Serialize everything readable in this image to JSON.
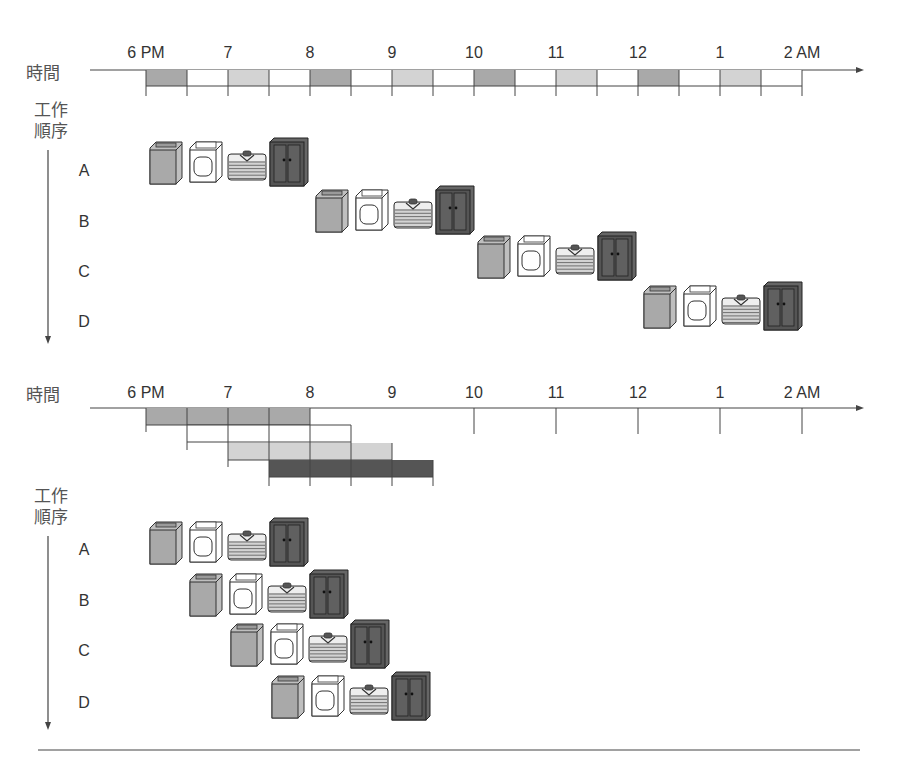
{
  "colors": {
    "washer": "#a9a9a9",
    "dryer": "#ffffff",
    "folder": "#d3d3d3",
    "closet": "#555555",
    "line": "#444444"
  },
  "icons": {
    "washer": "washing-machine-icon",
    "dryer": "dryer-icon",
    "folder": "folded-clothes-icon",
    "closet": "wardrobe-icon"
  },
  "sequential": {
    "time_axis_title": "時間",
    "task_axis_title": [
      "工作",
      "順序"
    ],
    "ticks": [
      "6 PM",
      "7",
      "8",
      "9",
      "10",
      "11",
      "12",
      "1",
      "2 AM"
    ],
    "jobs": [
      "A",
      "B",
      "C",
      "D"
    ]
  },
  "pipelined": {
    "time_axis_title": "時間",
    "task_axis_title": [
      "工作",
      "順序"
    ],
    "ticks": [
      "6 PM",
      "7",
      "8",
      "9",
      "10",
      "11",
      "12",
      "1",
      "2 AM"
    ],
    "jobs": [
      "A",
      "B",
      "C",
      "D"
    ]
  },
  "chart_data": [
    {
      "type": "gantt",
      "title": "Sequential laundry",
      "xlabel": "時間",
      "ylabel": "工作順序",
      "x_ticks": [
        "6 PM",
        "7",
        "8",
        "9",
        "10",
        "11",
        "12",
        "1",
        "2 AM"
      ],
      "stage_duration_minutes": 30,
      "stages": [
        "wash",
        "dry",
        "fold",
        "store"
      ],
      "tasks": [
        {
          "name": "A",
          "start": "6:00 PM",
          "end": "8:00 PM"
        },
        {
          "name": "B",
          "start": "8:00 PM",
          "end": "10:00 PM"
        },
        {
          "name": "C",
          "start": "10:00 PM",
          "end": "12:00 AM"
        },
        {
          "name": "D",
          "start": "12:00 AM",
          "end": "2:00 AM"
        }
      ],
      "total_hours": 8
    },
    {
      "type": "gantt",
      "title": "Pipelined laundry",
      "xlabel": "時間",
      "ylabel": "工作順序",
      "x_ticks": [
        "6 PM",
        "7",
        "8",
        "9",
        "10",
        "11",
        "12",
        "1",
        "2 AM"
      ],
      "stage_duration_minutes": 30,
      "stages": [
        "wash",
        "dry",
        "fold",
        "store"
      ],
      "tasks": [
        {
          "name": "A",
          "start": "6:00 PM",
          "end": "8:00 PM"
        },
        {
          "name": "B",
          "start": "6:30 PM",
          "end": "8:30 PM"
        },
        {
          "name": "C",
          "start": "7:00 PM",
          "end": "9:00 PM"
        },
        {
          "name": "D",
          "start": "7:30 PM",
          "end": "9:30 PM"
        }
      ],
      "total_hours": 3.5
    }
  ]
}
